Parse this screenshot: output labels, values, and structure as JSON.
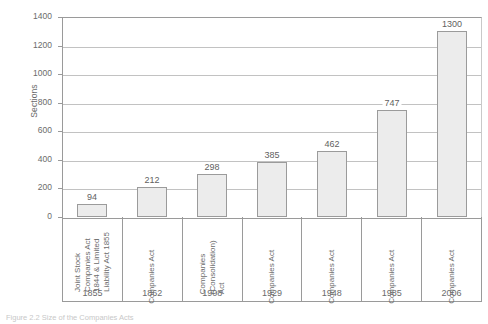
{
  "chart_data": {
    "type": "bar",
    "title": "",
    "xlabel": "",
    "ylabel": "Sections",
    "ylim": [
      0,
      1400
    ],
    "ytick_step": 200,
    "yticks": [
      0,
      200,
      400,
      600,
      800,
      1000,
      1200,
      1400
    ],
    "grid": true,
    "legend": null,
    "categories": [
      "1855",
      "1862",
      "1908",
      "1929",
      "1948",
      "1985",
      "2006"
    ],
    "category_acts": [
      "Joint Stock Companies Act 1844 & Limited Liability Act 1855",
      "Companies Act",
      "Companies (Consolidation) Act",
      "Companies Act",
      "Companies Act",
      "Companies Act",
      "Companies Act"
    ],
    "values": [
      94,
      212,
      298,
      385,
      462,
      747,
      1300
    ],
    "bar_fill": "#ececec",
    "bar_stroke": "#9b9b9b",
    "grid_color": "#c2c2c2",
    "axis_color": "#9a9a9a",
    "text_color": "#6b6b6b"
  },
  "axes": {
    "y_title": "Sections",
    "y_tick_labels": [
      "1400",
      "1200",
      "1000",
      "800",
      "600",
      "400",
      "200",
      "0"
    ]
  },
  "bars": [
    {
      "act_lines": [
        "Joint Stock",
        "Companies Act",
        "1844 & Limited",
        "Liability Act 1855"
      ],
      "year": "1855",
      "value_label": "94",
      "value": 94
    },
    {
      "act_lines": [
        "Companies Act"
      ],
      "year": "1862",
      "value_label": "212",
      "value": 212
    },
    {
      "act_lines": [
        "Companies",
        "(Consolidation)",
        "Act"
      ],
      "year": "1908",
      "value_label": "298",
      "value": 298
    },
    {
      "act_lines": [
        "Companies Act"
      ],
      "year": "1929",
      "value_label": "385",
      "value": 385
    },
    {
      "act_lines": [
        "Companies Act"
      ],
      "year": "1948",
      "value_label": "462",
      "value": 462
    },
    {
      "act_lines": [
        "Companies Act"
      ],
      "year": "1985",
      "value_label": "747",
      "value": 747
    },
    {
      "act_lines": [
        "Companies Act"
      ],
      "year": "2006",
      "value_label": "1300",
      "value": 1300
    }
  ],
  "caption": {
    "text": "Figure 2.2 Size of the Companies Acts"
  }
}
